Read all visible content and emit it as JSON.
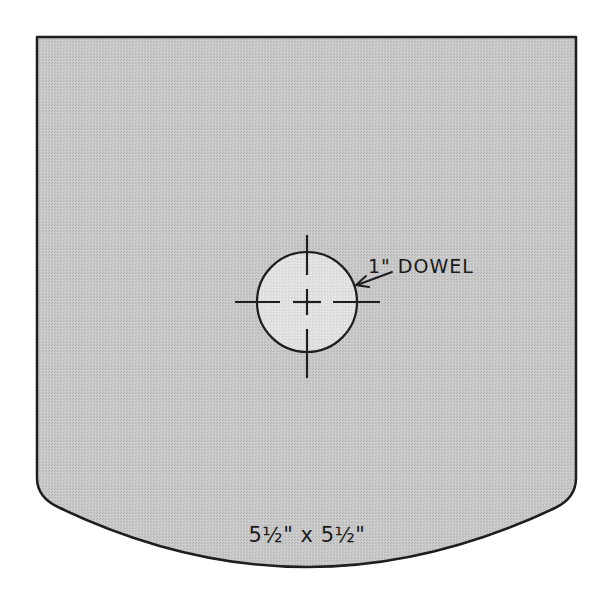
{
  "diagram": {
    "type": "woodworking-part-drawing",
    "part": {
      "shape": "square plate with convex curved bottom edge",
      "fill_color": "#c4c4c4",
      "outline_color": "#1e1e1e"
    },
    "hole": {
      "label": "1\" DOWEL",
      "fill_color": "#dcdcdc",
      "marking": "centered crosshair with dashed center lines"
    },
    "dimension_label": "5½\" x 5½\""
  }
}
